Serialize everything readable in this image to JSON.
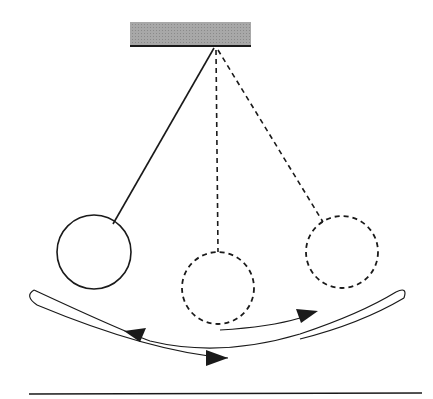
{
  "diagram": {
    "title": "",
    "colors": {
      "background": "#ffffff",
      "stroke": "#1a1a1a",
      "support_fill": "#9a9a9a"
    },
    "elements": [
      {
        "id": "support",
        "type": "fixed-support",
        "label": ""
      },
      {
        "id": "bob-left",
        "type": "pendulum-bob",
        "style": "solid",
        "label": ""
      },
      {
        "id": "bob-center",
        "type": "pendulum-bob",
        "style": "dashed",
        "label": ""
      },
      {
        "id": "bob-right",
        "type": "pendulum-bob",
        "style": "dashed",
        "label": ""
      },
      {
        "id": "motion-path",
        "type": "curved-arrows",
        "label": ""
      },
      {
        "id": "ground",
        "type": "line",
        "label": ""
      }
    ]
  }
}
